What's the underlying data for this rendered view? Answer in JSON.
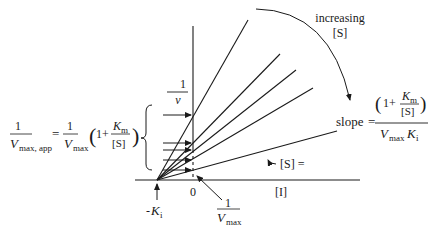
{
  "diagram": {
    "type": "Dixon-style plot (1/v vs [I]) for competitive inhibition",
    "y_axis": {
      "label_num": "1",
      "label_den": "v"
    },
    "x_axis": {
      "label": "[I]",
      "origin_label": "0"
    },
    "x_intercept": {
      "label_sign": "-",
      "label_var": "K",
      "label_sub": "i"
    },
    "y_intercept_label": {
      "num": "1",
      "den_var": "V",
      "den_sub": "max"
    },
    "curve_annotation": {
      "line1": "increasing",
      "line2": "[S]"
    },
    "lowest_line_label": "[S] =",
    "left_equation": {
      "lhs_num": "1",
      "lhs_den_var": "V",
      "lhs_den_sub": "max, app",
      "equals": "=",
      "rhs_num": "1",
      "rhs_den_var": "V",
      "rhs_den_sub": "max",
      "paren_open": "(",
      "one_plus": "1+",
      "km_var": "K",
      "km_sub": "m",
      "s_den": "[S]",
      "paren_close": ")"
    },
    "slope_equation": {
      "label": "slope",
      "equals": "=",
      "paren_open": "(",
      "one_plus": "1+",
      "km_var": "K",
      "km_sub": "m",
      "s_den": "[S]",
      "paren_close": ")",
      "den_vmax_var": "V",
      "den_vmax_sub": "max",
      "den_ki_var": "K",
      "den_ki_sub": "i"
    },
    "lines": [
      {
        "x2": 248,
        "y2": 20
      },
      {
        "x2": 280,
        "y2": 54
      },
      {
        "x2": 296,
        "y2": 70
      },
      {
        "x2": 313,
        "y2": 88
      },
      {
        "x2": 337,
        "y2": 131
      }
    ],
    "intercept_arrows_y": [
      115,
      143,
      150,
      160,
      170
    ],
    "colors": {
      "ink": "#1a1a1a",
      "background": "#ffffff"
    }
  }
}
